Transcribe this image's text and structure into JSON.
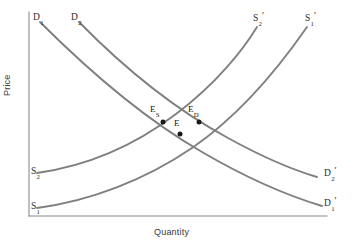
{
  "figure": {
    "type": "economics-supply-demand-diagram",
    "background_color": "#ffffff",
    "curve_color": "#7f7f7f",
    "axis_color": "#8a8a8a",
    "marker_color": "#1a1a1a",
    "width": 356,
    "height": 245
  },
  "axes": {
    "y_label": "Price",
    "x_label": "Quantity",
    "origin": {
      "x": 29,
      "y": 216
    },
    "y_top": 12,
    "x_right": 327,
    "ticks": [],
    "grid": false
  },
  "curves": [
    {
      "id": "demand-1",
      "kind": "demand",
      "slope": "downward",
      "start_label": "D",
      "start_sub": "1",
      "end_label": "D",
      "end_sub": "1",
      "end_prime": "′",
      "path": "M 40 22 C 96 78, 150 122, 202 152 C 250 180, 292 197, 322 206",
      "start_point": {
        "x": 40,
        "y": 22
      },
      "end_point": {
        "x": 322,
        "y": 206
      }
    },
    {
      "id": "demand-2",
      "kind": "demand",
      "slope": "downward",
      "start_label": "D",
      "start_sub": "2",
      "end_label": "D",
      "end_sub": "2",
      "end_prime": "′",
      "path": "M 79 22 C 130 74, 180 112, 228 138 C 268 160, 300 172, 317 177",
      "start_point": {
        "x": 79,
        "y": 22
      },
      "end_point": {
        "x": 317,
        "y": 177
      }
    },
    {
      "id": "supply-1",
      "kind": "supply",
      "slope": "upward",
      "start_label": "S",
      "start_sub": "1",
      "end_label": "S",
      "end_sub": "1",
      "end_prime": "′",
      "path": "M 37 208 C 90 201, 145 180, 192 148 C 240 115, 280 66, 307 27",
      "start_point": {
        "x": 37,
        "y": 208
      },
      "end_point": {
        "x": 307,
        "y": 27
      }
    },
    {
      "id": "supply-2",
      "kind": "supply",
      "slope": "upward",
      "start_label": "S",
      "start_sub": "2",
      "end_label": "S",
      "end_sub": "2",
      "end_prime": "′",
      "path": "M 37 173 C 86 166, 134 146, 176 114 C 216 84, 243 50, 257 27",
      "start_point": {
        "x": 37,
        "y": 173
      },
      "end_point": {
        "x": 257,
        "y": 27
      }
    }
  ],
  "labels": {
    "d1_start": {
      "text": "D",
      "sub": "1",
      "x": 33,
      "y": 13
    },
    "d2_start": {
      "text": "D",
      "sub": "2",
      "x": 71,
      "y": 13
    },
    "s2_prime_end": {
      "text": "S",
      "sub": "2",
      "prime": "′",
      "x": 253,
      "y": 14
    },
    "s1_prime_end": {
      "text": "S",
      "sub": "1",
      "prime": "′",
      "x": 305,
      "y": 14
    },
    "s2_start": {
      "text": "S",
      "sub": "2",
      "x": 31,
      "y": 167
    },
    "s1_start": {
      "text": "S",
      "sub": "1",
      "x": 31,
      "y": 202
    },
    "d2_prime_end": {
      "text": "D",
      "sub": "2",
      "prime": "′",
      "x": 324,
      "y": 169
    },
    "d1_prime_end": {
      "text": "D",
      "sub": "1",
      "prime": "′",
      "x": 324,
      "y": 199
    }
  },
  "equilibria": [
    {
      "id": "equilibrium-supply",
      "label": "E",
      "sub": "S",
      "point": {
        "x": 163,
        "y": 122
      },
      "label_pos": {
        "x": 150,
        "y": 105
      }
    },
    {
      "id": "equilibrium-demand",
      "label": "E",
      "sub": "D",
      "point": {
        "x": 199,
        "y": 122
      },
      "label_pos": {
        "x": 188,
        "y": 105
      }
    },
    {
      "id": "equilibrium-original",
      "label": "E",
      "sub": "",
      "point": {
        "x": 180,
        "y": 134
      },
      "label_pos": {
        "x": 174,
        "y": 119
      }
    }
  ],
  "chart_data": {
    "type": "line",
    "title": "",
    "xlabel": "Quantity",
    "ylabel": "Price",
    "grid": false,
    "legend": "none",
    "series": [
      {
        "name": "D1",
        "kind": "demand",
        "direction": "downward-sloping",
        "endpoint_label": "D1′"
      },
      {
        "name": "D2",
        "kind": "demand",
        "direction": "downward-sloping",
        "endpoint_label": "D2′"
      },
      {
        "name": "S1",
        "kind": "supply",
        "direction": "upward-sloping",
        "endpoint_label": "S1′"
      },
      {
        "name": "S2",
        "kind": "supply",
        "direction": "upward-sloping",
        "endpoint_label": "S2′"
      }
    ],
    "annotations": [
      "E",
      "E_S",
      "E_D"
    ]
  }
}
